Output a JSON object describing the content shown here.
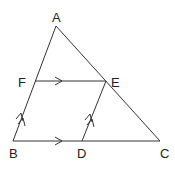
{
  "diagram": {
    "type": "geometry-triangle",
    "points": {
      "A": {
        "label": "A",
        "x": 56,
        "y": 26,
        "label_x": 52,
        "label_y": 22
      },
      "B": {
        "label": "B",
        "x": 13,
        "y": 141,
        "label_x": 9,
        "label_y": 158
      },
      "C": {
        "label": "C",
        "x": 160,
        "y": 141,
        "label_x": 160,
        "label_y": 158
      },
      "D": {
        "label": "D",
        "x": 82,
        "y": 141,
        "label_x": 77,
        "label_y": 158
      },
      "E": {
        "label": "E",
        "x": 106,
        "y": 81,
        "label_x": 111,
        "label_y": 87
      },
      "F": {
        "label": "F",
        "x": 35,
        "y": 81,
        "label_x": 18,
        "label_y": 87
      }
    },
    "segments": [
      {
        "from": "A",
        "to": "B"
      },
      {
        "from": "A",
        "to": "C"
      },
      {
        "from": "B",
        "to": "C"
      },
      {
        "from": "F",
        "to": "E",
        "marker": "single-arrow"
      },
      {
        "from": "D",
        "to": "E",
        "marker": "double-arrow"
      },
      {
        "from": "B",
        "to": "F",
        "marker": "double-arrow"
      },
      {
        "from": "B",
        "to": "D",
        "marker": "single-arrow"
      }
    ],
    "parallel_relations": [
      {
        "pair": [
          "FE",
          "BC"
        ],
        "marker": "single-arrow"
      },
      {
        "pair": [
          "BF",
          "DE"
        ],
        "marker": "double-arrow"
      }
    ],
    "colors": {
      "line": "#333333",
      "text": "#222222",
      "background": "#ffffff"
    }
  }
}
